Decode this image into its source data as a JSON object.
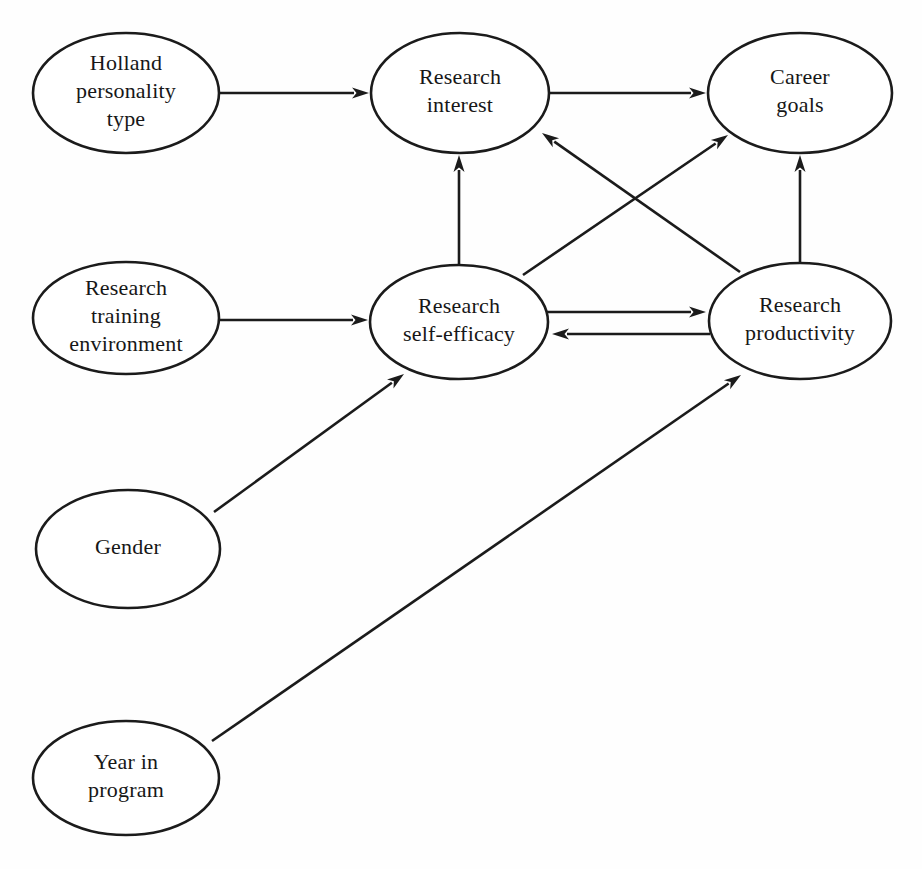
{
  "diagram": {
    "background_color": "#fefefe",
    "line_color": "#1b1b1b",
    "text_color": "#171717",
    "nodes": [
      {
        "id": "holland",
        "label_lines": [
          "Holland",
          "personality",
          "type"
        ],
        "cx": 126,
        "cy": 93,
        "rx": 93,
        "ry": 60
      },
      {
        "id": "research_interest",
        "label_lines": [
          "Research",
          "interest"
        ],
        "cx": 460,
        "cy": 93,
        "rx": 89,
        "ry": 60
      },
      {
        "id": "career_goals",
        "label_lines": [
          "Career",
          "goals"
        ],
        "cx": 800,
        "cy": 93,
        "rx": 92,
        "ry": 60
      },
      {
        "id": "research_training_environment",
        "label_lines": [
          "Research",
          "training",
          "environment"
        ],
        "cx": 126,
        "cy": 318,
        "rx": 93,
        "ry": 56
      },
      {
        "id": "research_self_efficacy",
        "label_lines": [
          "Research",
          "self-efficacy"
        ],
        "cx": 459,
        "cy": 322,
        "rx": 89,
        "ry": 57
      },
      {
        "id": "research_productivity",
        "label_lines": [
          "Research",
          "productivity"
        ],
        "cx": 800,
        "cy": 321,
        "rx": 91,
        "ry": 58
      },
      {
        "id": "gender",
        "label_lines": [
          "Gender"
        ],
        "cx": 128,
        "cy": 549,
        "rx": 92,
        "ry": 59
      },
      {
        "id": "year_in_program",
        "label_lines": [
          "Year in",
          "program"
        ],
        "cx": 126,
        "cy": 778,
        "rx": 93,
        "ry": 57
      }
    ],
    "edges": [
      {
        "id": "holland-to-interest",
        "from": "holland",
        "to": "research_interest",
        "x1": 219,
        "y1": 93,
        "x2": 369,
        "y2": 93
      },
      {
        "id": "interest-to-career",
        "from": "research_interest",
        "to": "career_goals",
        "x1": 550,
        "y1": 93,
        "x2": 706,
        "y2": 93
      },
      {
        "id": "rte-to-selfefficacy",
        "from": "research_training_environment",
        "to": "research_self_efficacy",
        "x1": 219,
        "y1": 320,
        "x2": 368,
        "y2": 320
      },
      {
        "id": "selfefficacy-to-interest",
        "from": "research_self_efficacy",
        "to": "research_interest",
        "x1": 459,
        "y1": 264,
        "x2": 459,
        "y2": 155
      },
      {
        "id": "productivity-to-career",
        "from": "research_productivity",
        "to": "career_goals",
        "x1": 800,
        "y1": 262,
        "x2": 800,
        "y2": 155
      },
      {
        "id": "productivity-to-interest",
        "from": "research_productivity",
        "to": "research_interest",
        "x1": 740,
        "y1": 272,
        "x2": 542,
        "y2": 133
      },
      {
        "id": "selfefficacy-to-career",
        "from": "research_self_efficacy",
        "to": "career_goals",
        "x1": 523,
        "y1": 275,
        "x2": 728,
        "y2": 135
      },
      {
        "id": "selfefficacy-to-productivity",
        "from": "research_self_efficacy",
        "to": "research_productivity",
        "x1": 547,
        "y1": 312,
        "x2": 706,
        "y2": 312
      },
      {
        "id": "productivity-to-selfefficacy",
        "from": "research_productivity",
        "to": "research_self_efficacy",
        "x1": 710,
        "y1": 334,
        "x2": 552,
        "y2": 334
      },
      {
        "id": "gender-to-selfefficacy",
        "from": "gender",
        "to": "research_self_efficacy",
        "x1": 214,
        "y1": 512,
        "x2": 404,
        "y2": 374
      },
      {
        "id": "year-to-productivity",
        "from": "year_in_program",
        "to": "research_productivity",
        "x1": 212,
        "y1": 741,
        "x2": 741,
        "y2": 375
      }
    ]
  }
}
